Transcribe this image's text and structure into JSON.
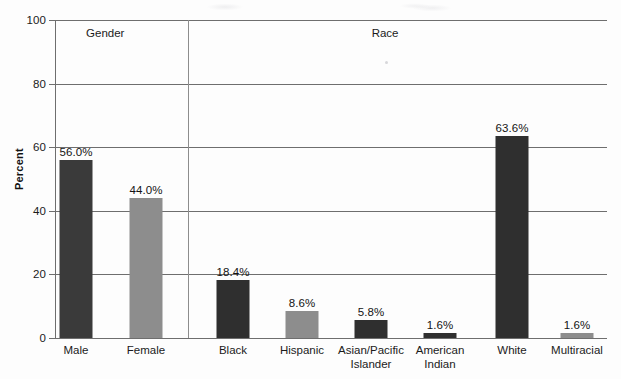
{
  "chart_data": {
    "type": "bar",
    "title": "",
    "subtitle": "",
    "xlabel": "",
    "ylabel": "Percent",
    "ylim": [
      0,
      100
    ],
    "yticks": [
      0,
      20,
      40,
      60,
      80,
      100
    ],
    "ytick_labels": [
      "0",
      "20",
      "40",
      "60",
      "80",
      "100"
    ],
    "grid": true,
    "legend": "none",
    "value_label_suffix": "%",
    "groups": [
      {
        "name": "Gender",
        "label": "Gender",
        "center_pct": 9.1
      },
      {
        "name": "Race",
        "label": "Race",
        "center_pct": 59.8
      }
    ],
    "categories": [
      "Male",
      "Female",
      "Black",
      "Hispanic",
      "Asian/Pacific Islander",
      "American Indian",
      "White",
      "Multiracial"
    ],
    "values": [
      56.0,
      44.0,
      18.4,
      8.6,
      5.8,
      1.6,
      63.6,
      1.6
    ],
    "bars": [
      {
        "category": "Male",
        "label_lines": [
          "Male"
        ],
        "value": 56.0,
        "value_label": "56.0%",
        "group": "Gender",
        "color": "#3a3a3a",
        "center_x": 76
      },
      {
        "category": "Female",
        "label_lines": [
          "Female"
        ],
        "value": 44.0,
        "value_label": "44.0%",
        "group": "Gender",
        "color": "#8d8d8d",
        "center_x": 146
      },
      {
        "category": "Black",
        "label_lines": [
          "Black"
        ],
        "value": 18.4,
        "value_label": "18.4%",
        "group": "Race",
        "color": "#2f2f2f",
        "center_x": 233
      },
      {
        "category": "Hispanic",
        "label_lines": [
          "Hispanic"
        ],
        "value": 8.6,
        "value_label": "8.6%",
        "group": "Race",
        "color": "#8d8d8d",
        "center_x": 302
      },
      {
        "category": "Asian/Pacific Islander",
        "label_lines": [
          "Asian/Pacific",
          "Islander"
        ],
        "value": 5.8,
        "value_label": "5.8%",
        "group": "Race",
        "color": "#2f2f2f",
        "center_x": 371
      },
      {
        "category": "American Indian",
        "label_lines": [
          "American",
          "Indian"
        ],
        "value": 1.6,
        "value_label": "1.6%",
        "group": "Race",
        "color": "#2f2f2f",
        "center_x": 440
      },
      {
        "category": "White",
        "label_lines": [
          "White"
        ],
        "value": 63.6,
        "value_label": "63.6%",
        "group": "Race",
        "color": "#2f2f2f",
        "center_x": 512
      },
      {
        "category": "Multiracial",
        "label_lines": [
          "Multiracial"
        ],
        "value": 1.6,
        "value_label": "1.6%",
        "group": "Race",
        "color": "#8d8d8d",
        "center_x": 577
      }
    ],
    "colors": {
      "bar_dark": "#2f2f2f",
      "bar_light": "#8d8d8d",
      "gridline": "#6e6e6e",
      "divider": "#8d8d8d",
      "text": "#1b1b1b",
      "background": "#fdfdfd"
    }
  }
}
